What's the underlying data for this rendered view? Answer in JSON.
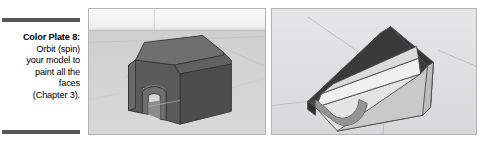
{
  "figure": {
    "caption": {
      "title": "Color Plate 8:",
      "lines": [
        "Orbit (spin)",
        "your model to",
        "paint all the",
        "faces",
        "(Chapter 3)."
      ],
      "rule_color": "#58585a",
      "text_color": "#000000"
    },
    "panels": [
      {
        "name": "sketchup-viewport-front-orbit",
        "description": "SketchUp 3D viewport showing a gray arched barn/tunnel model seen from the front-above with the dark shaded exterior faces visible",
        "sky_color": "#f2f2f2",
        "ground_color": "#d2d2d2",
        "horizon_color": "#c8c8c8",
        "model_colors": {
          "roof_top": "#6b6b6b",
          "front_face": "#5a5a5a",
          "side_face": "#4e4e4e",
          "arch_inner": "#747474",
          "edge": "#3a3a3a"
        },
        "axis_line_color": "#b9b9c4"
      },
      {
        "name": "sketchup-viewport-under-orbit",
        "description": "SketchUp 3D viewport showing the same arched model orbited underneath so the white back faces of the interior are visible",
        "sky_color": "#e2e2e4",
        "ground_color": "#dcdcdc",
        "model_colors": {
          "outer_dark": "#3b3b3b",
          "inner_white": "#f0f0f0",
          "inner_light": "#dcdcdc",
          "inner_mid": "#c6c6c6",
          "edge": "#545454"
        },
        "axis_line_color": "#9a9aa6"
      }
    ]
  }
}
